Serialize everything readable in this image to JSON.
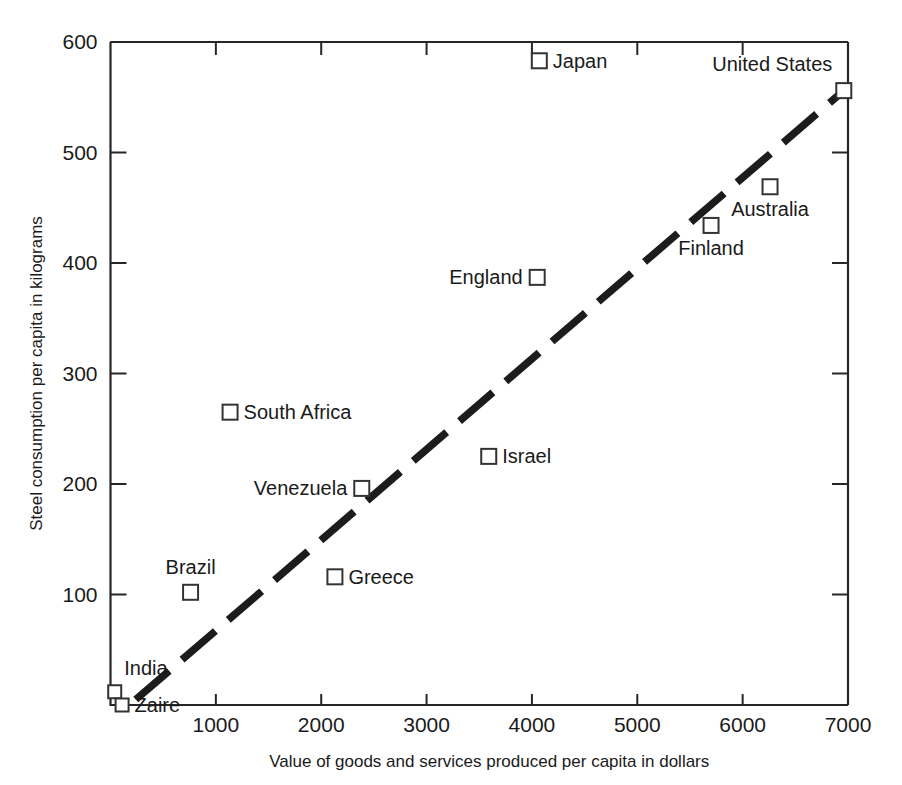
{
  "chart_data": {
    "type": "scatter",
    "title": "",
    "xlabel": "Value of goods and services produced per capita in dollars",
    "ylabel": "Steel consumption per capita in kilograms",
    "xlim": [
      0,
      7000
    ],
    "ylim": [
      0,
      600
    ],
    "xticks": [
      1000,
      2000,
      3000,
      4000,
      5000,
      6000,
      7000
    ],
    "yticks": [
      100,
      200,
      300,
      400,
      500,
      600
    ],
    "grid": false,
    "legend": "none",
    "marker": "open-square",
    "points": [
      {
        "label": "Japan",
        "x": 4070,
        "y": 583,
        "label_side": "right"
      },
      {
        "label": "United States",
        "x": 6960,
        "y": 556,
        "label_side": "above-left"
      },
      {
        "label": "Australia",
        "x": 6260,
        "y": 469,
        "label_side": "below"
      },
      {
        "label": "Finland",
        "x": 5700,
        "y": 434,
        "label_side": "below"
      },
      {
        "label": "England",
        "x": 4050,
        "y": 387,
        "label_side": "left"
      },
      {
        "label": "South Africa",
        "x": 1135,
        "y": 265,
        "label_side": "right"
      },
      {
        "label": "Israel",
        "x": 3590,
        "y": 225,
        "label_side": "right"
      },
      {
        "label": "Venezuela",
        "x": 2385,
        "y": 196,
        "label_side": "left"
      },
      {
        "label": "Greece",
        "x": 2130,
        "y": 116,
        "label_side": "right"
      },
      {
        "label": "Brazil",
        "x": 760,
        "y": 102,
        "label_side": "above"
      },
      {
        "label": "India",
        "x": 40,
        "y": 12,
        "label_side": "above-right"
      },
      {
        "label": "Zaire",
        "x": 110,
        "y": 0,
        "label_side": "right"
      }
    ],
    "trend": {
      "style": "dashed",
      "x0": 240,
      "y0": 5,
      "x1": 6960,
      "y1": 556
    }
  },
  "axis": {
    "x_title": "Value of goods and services produced per capita in dollars",
    "y_title": "Steel consumption per capita in kilograms",
    "x_tick_labels": [
      "1000",
      "2000",
      "3000",
      "4000",
      "5000",
      "6000",
      "7000"
    ],
    "y_tick_labels": [
      "100",
      "200",
      "300",
      "400",
      "500",
      "600"
    ]
  },
  "colors": {
    "ink": "#1a1a1a",
    "axis": "#262626",
    "marker_fill": "#ffffff",
    "marker_stroke": "#333333",
    "trend": "#1c1c1c",
    "background": "#ffffff"
  }
}
